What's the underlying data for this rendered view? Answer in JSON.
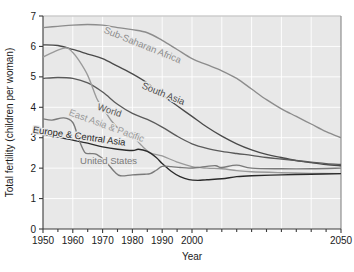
{
  "chart_data": {
    "type": "line",
    "title": "",
    "xlabel": "Year",
    "ylabel": "Total fertility (children per woman)",
    "xlim": [
      1950,
      2050
    ],
    "ylim": [
      0,
      7
    ],
    "xticks": [
      1950,
      1960,
      1970,
      1980,
      1990,
      2000,
      2050
    ],
    "xtick_labels": [
      "1950",
      "1960",
      "1970",
      "1980",
      "1990",
      "2000",
      "2050"
    ],
    "yticks": [
      0,
      1,
      2,
      3,
      4,
      5,
      6,
      7
    ],
    "ytick_labels": [
      "0",
      "1",
      "2",
      "3",
      "4",
      "5",
      "6",
      "7"
    ],
    "grid": "horizontal-and-vertical-light",
    "legend": "inline-curve-labels",
    "plot_background": "#e8e8e8",
    "series": [
      {
        "name": "Sub-Saharan Africa",
        "color": "#8c8c8c",
        "label_x": 1983,
        "label_y": 5.95,
        "label_rotate": 22,
        "x": [
          1950,
          1955,
          1960,
          1965,
          1970,
          1975,
          1980,
          1985,
          1990,
          1995,
          2000,
          2005,
          2010,
          2015,
          2020,
          2025,
          2030,
          2035,
          2040,
          2045,
          2050
        ],
        "values": [
          6.62,
          6.66,
          6.7,
          6.72,
          6.7,
          6.62,
          6.55,
          6.45,
          6.2,
          5.9,
          5.6,
          5.4,
          5.2,
          4.95,
          4.6,
          4.25,
          3.95,
          3.7,
          3.45,
          3.2,
          3.0
        ]
      },
      {
        "name": "South Asia",
        "color": "#4a4a4a",
        "label_x": 1990,
        "label_y": 4.35,
        "label_rotate": 22,
        "x": [
          1950,
          1955,
          1960,
          1965,
          1970,
          1975,
          1980,
          1985,
          1990,
          1995,
          2000,
          2005,
          2010,
          2015,
          2020,
          2025,
          2030,
          2035,
          2040,
          2045,
          2050
        ],
        "values": [
          6.05,
          6.03,
          5.9,
          5.75,
          5.6,
          5.35,
          5.1,
          4.8,
          4.4,
          4.05,
          3.7,
          3.35,
          3.05,
          2.8,
          2.6,
          2.45,
          2.35,
          2.25,
          2.18,
          2.12,
          2.08
        ]
      },
      {
        "name": "World",
        "color": "#5a5a5a",
        "label_x": 1972,
        "label_y": 3.8,
        "label_rotate": 18,
        "x": [
          1950,
          1955,
          1960,
          1965,
          1970,
          1975,
          1980,
          1985,
          1990,
          1995,
          2000,
          2005,
          2010,
          2015,
          2020,
          2025,
          2030,
          2035,
          2040,
          2045,
          2050
        ],
        "values": [
          4.95,
          4.98,
          4.95,
          4.8,
          4.5,
          4.1,
          3.8,
          3.6,
          3.35,
          3.05,
          2.8,
          2.65,
          2.55,
          2.48,
          2.42,
          2.35,
          2.3,
          2.25,
          2.2,
          2.15,
          2.12
        ]
      },
      {
        "name": "East Asia & Pacific",
        "color": "#9a9a9a",
        "label_x": 1971,
        "label_y": 3.3,
        "label_rotate": 20,
        "x": [
          1950,
          1955,
          1958,
          1960,
          1962,
          1965,
          1968,
          1970,
          1973,
          1976,
          1980,
          1983,
          1986,
          1990,
          1995,
          2000,
          2005,
          2010,
          2015,
          2020,
          2030,
          2040,
          2050
        ],
        "values": [
          5.65,
          5.88,
          5.95,
          5.8,
          5.55,
          5.05,
          4.3,
          4.0,
          3.55,
          3.25,
          3.05,
          2.75,
          2.5,
          2.4,
          2.2,
          2.05,
          2.0,
          1.98,
          1.92,
          1.88,
          1.85,
          1.83,
          1.82
        ]
      },
      {
        "name": "Europe & Central Asia",
        "color": "#2a2a2a",
        "label_x": 1962,
        "label_y": 2.95,
        "label_rotate": 8,
        "x": [
          1950,
          1955,
          1960,
          1965,
          1970,
          1975,
          1980,
          1982,
          1985,
          1988,
          1990,
          1993,
          1996,
          1999,
          2002,
          2005,
          2010,
          2015,
          2020,
          2030,
          2040,
          2050
        ],
        "values": [
          3.1,
          3.02,
          2.92,
          2.82,
          2.7,
          2.62,
          2.58,
          2.62,
          2.55,
          2.35,
          2.15,
          1.9,
          1.72,
          1.62,
          1.6,
          1.62,
          1.65,
          1.72,
          1.75,
          1.78,
          1.8,
          1.82
        ]
      },
      {
        "name": "United States",
        "color": "#7a7a7a",
        "label_x": 1972,
        "label_y": 2.12,
        "label_rotate": 0,
        "x": [
          1950,
          1953,
          1957,
          1960,
          1962,
          1964,
          1966,
          1968,
          1971,
          1974,
          1976,
          1980,
          1984,
          1986,
          1988,
          1990,
          1993,
          1996,
          1999,
          2002,
          2005,
          2008,
          2010,
          2015,
          2020,
          2030,
          2040,
          2050
        ],
        "values": [
          3.62,
          3.58,
          3.65,
          3.5,
          2.95,
          2.52,
          2.48,
          2.45,
          2.22,
          1.88,
          1.75,
          1.78,
          1.8,
          1.82,
          1.93,
          2.06,
          2.05,
          2.02,
          2.0,
          2.02,
          2.06,
          2.08,
          2.02,
          2.1,
          2.0,
          1.98,
          1.98,
          2.0
        ]
      }
    ]
  }
}
